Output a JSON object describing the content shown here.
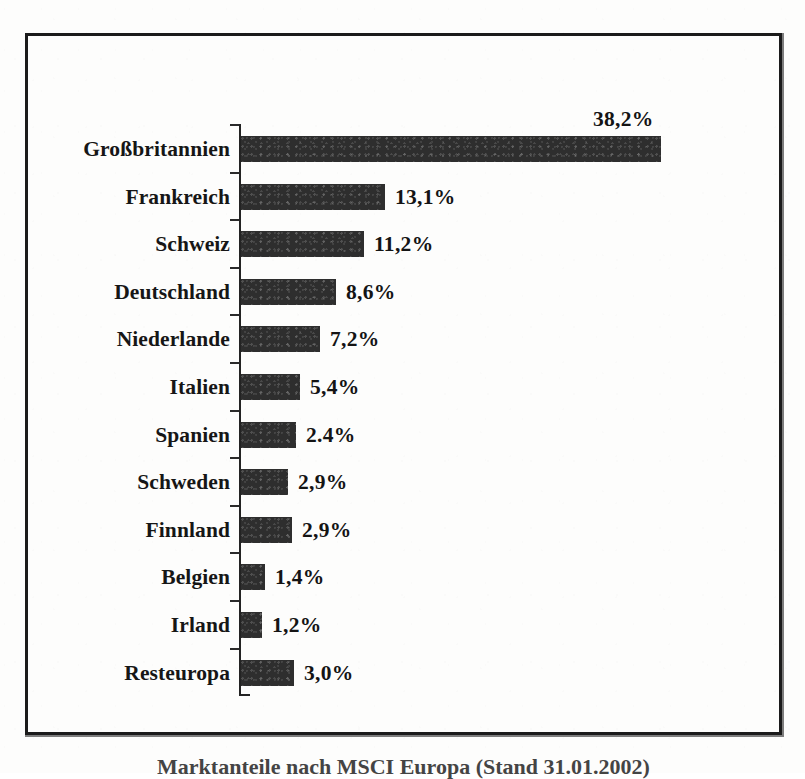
{
  "document": {
    "type": "scanned-figure",
    "language": "de"
  },
  "caption": {
    "text": "Marktanteile nach MSCI Europa (Stand 31.01.2002)",
    "note": "clipped at bottom edge of page"
  },
  "colors": {
    "bar": "#2e2e2e",
    "axis": "#232323",
    "frame": "#1b1b1b",
    "text": "#161616",
    "paper": "#fdfdfc"
  },
  "chart_data": {
    "type": "bar",
    "orientation": "horizontal",
    "title": "",
    "subtitle": "",
    "xlabel": "",
    "ylabel": "",
    "grid": false,
    "legend": null,
    "axis_visible": "category-axis-only",
    "value_unit": "%",
    "xlim": [
      0,
      38.2
    ],
    "categories": [
      "Großbritannien",
      "Frankreich",
      "Schweiz",
      "Deutschland",
      "Niederlande",
      "Italien",
      "Spanien",
      "Schweden",
      "Finnland",
      "Belgien",
      "Irland",
      "Resteuropa"
    ],
    "values": [
      38.2,
      13.1,
      11.2,
      8.6,
      7.2,
      5.4,
      2.4,
      2.9,
      2.9,
      1.4,
      1.2,
      3.0
    ],
    "value_labels": [
      "38,2%",
      "13,1%",
      "11,2%",
      "8,6%",
      "7,2%",
      "5,4%",
      "2.4%",
      "2,9%",
      "2,9%",
      "1,4%",
      "1,2%",
      "3,0%"
    ],
    "bar_pixel_lengths": [
      420,
      144,
      123,
      95,
      79,
      59,
      55,
      47,
      51,
      24,
      21,
      53
    ],
    "rows": [
      {
        "label": "Großbritannien",
        "value": 38.2,
        "display": "38,2%",
        "label_position": "above-bar-end"
      },
      {
        "label": "Frankreich",
        "value": 13.1,
        "display": "13,1%",
        "label_position": "right-of-bar"
      },
      {
        "label": "Schweiz",
        "value": 11.2,
        "display": "11,2%",
        "label_position": "right-of-bar"
      },
      {
        "label": "Deutschland",
        "value": 8.6,
        "display": "8,6%",
        "label_position": "right-of-bar"
      },
      {
        "label": "Niederlande",
        "value": 7.2,
        "display": "7,2%",
        "label_position": "right-of-bar"
      },
      {
        "label": "Italien",
        "value": 5.4,
        "display": "5,4%",
        "label_position": "right-of-bar"
      },
      {
        "label": "Spanien",
        "value": 2.4,
        "display": "2.4%",
        "label_position": "right-of-bar"
      },
      {
        "label": "Schweden",
        "value": 2.9,
        "display": "2,9%",
        "label_position": "right-of-bar"
      },
      {
        "label": "Finnland",
        "value": 2.9,
        "display": "2,9%",
        "label_position": "right-of-bar"
      },
      {
        "label": "Belgien",
        "value": 1.4,
        "display": "1,4%",
        "label_position": "right-of-bar"
      },
      {
        "label": "Irland",
        "value": 1.2,
        "display": "1,2%",
        "label_position": "right-of-bar"
      },
      {
        "label": "Resteuropa",
        "value": 3.0,
        "display": "3,0%",
        "label_position": "right-of-bar"
      }
    ]
  }
}
